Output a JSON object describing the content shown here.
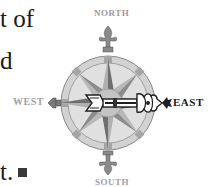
{
  "document": {
    "text_fragments": [
      {
        "id": "line1",
        "text": "t of"
      },
      {
        "id": "line2",
        "text": "d"
      },
      {
        "id": "line3",
        "text": "t."
      }
    ],
    "end_mark": "■"
  },
  "figure": {
    "type": "compass-rose",
    "labels": {
      "north": "NORTH",
      "south": "SOUTH",
      "east": "EAST",
      "west": "WEST"
    },
    "pointer_direction": "EAST",
    "colors": {
      "ring_outer": "#c8c8c8",
      "ring_band": "#a8a8a8",
      "point_dark": "#7a7a7a",
      "point_light": "#b5b5b5",
      "label_muted": "#9a9a9a",
      "label_strong": "#1a1a1a",
      "arrow": "#222222"
    }
  }
}
